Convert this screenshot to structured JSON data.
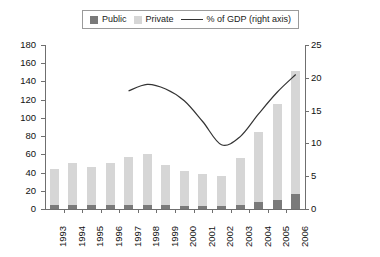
{
  "legend": {
    "items": [
      {
        "label": "Public",
        "kind": "swatch",
        "color": "#7a7a7a",
        "icon": "square-swatch-icon"
      },
      {
        "label": "Private",
        "kind": "swatch",
        "color": "#d6d6d6",
        "icon": "square-swatch-icon"
      },
      {
        "label": "% of GDP (right axis)",
        "kind": "line",
        "color": "#333333",
        "icon": "line-swatch-icon"
      }
    ],
    "position": "top-center"
  },
  "axes": {
    "left_ticks": [
      "0",
      "20",
      "40",
      "60",
      "80",
      "100",
      "120",
      "140",
      "160",
      "180"
    ],
    "right_ticks": [
      "0",
      "5",
      "10",
      "15",
      "20",
      "25"
    ]
  },
  "chart_data": {
    "type": "bar",
    "title": "",
    "subtitle": "",
    "xlabel": "",
    "ylabel": "",
    "y2label": "% of GDP (right axis)",
    "grid": false,
    "legend_position": "top-center",
    "categories": [
      "1993",
      "1994",
      "1995",
      "1996",
      "1997",
      "1998",
      "1999",
      "2000",
      "2001",
      "2002",
      "2003",
      "2004",
      "2005",
      "2006"
    ],
    "ylim": [
      0,
      180
    ],
    "y2lim": [
      0,
      25
    ],
    "stacked": true,
    "series": [
      {
        "name": "Public",
        "axis": "left",
        "type": "bar",
        "values": [
          4,
          4,
          4,
          4,
          4,
          4,
          4,
          3,
          3,
          3,
          4,
          8,
          10,
          17
        ]
      },
      {
        "name": "Private",
        "axis": "left",
        "type": "bar",
        "values": [
          40,
          47,
          42,
          46,
          53,
          56,
          44,
          39,
          35,
          33,
          52,
          77,
          105,
          135
        ]
      },
      {
        "name": "Total",
        "axis": "left",
        "type": "bar-total",
        "values": [
          44,
          51,
          46,
          50,
          57,
          60,
          48,
          42,
          38,
          36,
          56,
          85,
          115,
          152
        ]
      },
      {
        "name": "% of GDP (right axis)",
        "axis": "right",
        "type": "line",
        "x": [
          "1997",
          "1998",
          "1999",
          "2000",
          "2001",
          "2002",
          "2003",
          "2004",
          "2005",
          "2006"
        ],
        "values": [
          18.0,
          19.0,
          18.3,
          16.5,
          13.3,
          9.8,
          11.0,
          14.5,
          17.8,
          20.5
        ]
      }
    ]
  }
}
